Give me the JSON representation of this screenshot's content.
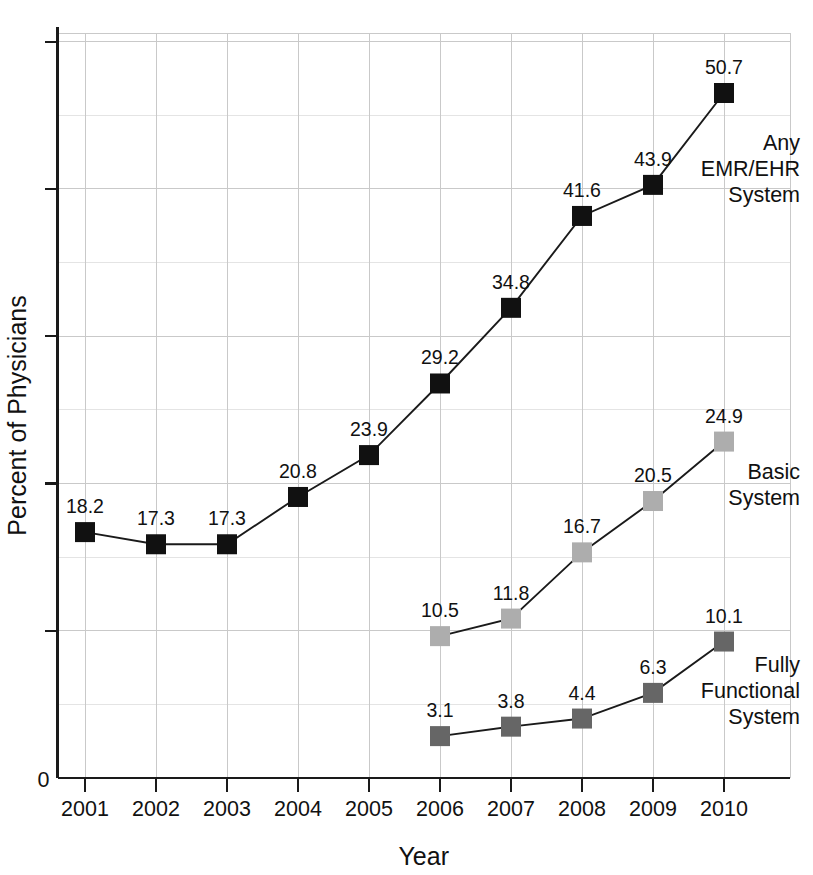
{
  "chart_data": {
    "type": "line",
    "title": "",
    "xlabel": "Year",
    "ylabel": "Percent of Physicians",
    "categories": [
      "2001",
      "2002",
      "2003",
      "2004",
      "2005",
      "2006",
      "2007",
      "2008",
      "2009",
      "2010"
    ],
    "x": [
      2001,
      2002,
      2003,
      2004,
      2005,
      2006,
      2007,
      2008,
      2009,
      2010
    ],
    "xlim": [
      2000.6,
      2010.6
    ],
    "ylim": [
      0,
      55
    ],
    "grid": true,
    "legend_position": "right-inline",
    "y_axis_origin_label": "0",
    "y_major_tick_interval": 10.9,
    "series": [
      {
        "name": "Any EMR/EHR System",
        "label_lines": [
          "Any",
          "EMR/EHR",
          "System"
        ],
        "color": "#111111",
        "marker": "square",
        "x": [
          2001,
          2002,
          2003,
          2004,
          2005,
          2006,
          2007,
          2008,
          2009,
          2010
        ],
        "values": [
          18.2,
          17.3,
          17.3,
          20.8,
          23.9,
          29.2,
          34.8,
          41.6,
          43.9,
          50.7
        ],
        "point_labels": [
          "18.2",
          "17.3",
          "17.3",
          "20.8",
          "23.9",
          "29.2",
          "34.8",
          "41.6",
          "43.9",
          "50.7"
        ]
      },
      {
        "name": "Basic System",
        "label_lines": [
          "Basic",
          "System"
        ],
        "color": "#adadad",
        "marker": "square",
        "x": [
          2006,
          2007,
          2008,
          2009,
          2010
        ],
        "values": [
          10.5,
          11.8,
          16.7,
          20.5,
          24.9
        ],
        "point_labels": [
          "10.5",
          "11.8",
          "16.7",
          "20.5",
          "24.9"
        ]
      },
      {
        "name": "Fully Functional System",
        "label_lines": [
          "Fully",
          "Functional",
          "System"
        ],
        "color": "#666666",
        "marker": "square",
        "x": [
          2006,
          2007,
          2008,
          2009,
          2010
        ],
        "values": [
          3.1,
          3.8,
          4.4,
          6.3,
          10.1
        ],
        "point_labels": [
          "3.1",
          "3.8",
          "4.4",
          "6.3",
          "10.1"
        ]
      }
    ]
  },
  "axes": {
    "x_title": "Year",
    "y_title": "Percent of Physicians",
    "origin": "0"
  }
}
